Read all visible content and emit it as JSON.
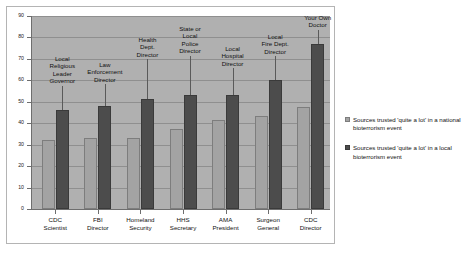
{
  "chart_data": {
    "type": "bar",
    "title": "",
    "subtitle": "",
    "xlabel": "",
    "ylabel": "",
    "ylim": [
      0,
      90
    ],
    "yticks": [
      0,
      10,
      20,
      30,
      40,
      50,
      60,
      70,
      80,
      90
    ],
    "grid": true,
    "legend_position": "right",
    "categories": [
      "CDC Scientist",
      "FBI Director",
      "Homeland Security",
      "HHS Secretary",
      "AMA President",
      "Surgeon General",
      "CDC Director"
    ],
    "category_lines": [
      [
        "CDC",
        "Scientist"
      ],
      [
        "FBI",
        "Director"
      ],
      [
        "Homeland",
        "Security"
      ],
      [
        "HHS",
        "Secretary"
      ],
      [
        "AMA",
        "President"
      ],
      [
        "Surgeon",
        "General"
      ],
      [
        "CDC",
        "Director"
      ]
    ],
    "series": [
      {
        "name": "Sources trusted 'quite a lot' in a national bioterrorism event",
        "color": "#a3a3a3",
        "values": [
          32,
          33,
          33,
          37.5,
          41.5,
          43.5,
          47.5
        ]
      },
      {
        "name": "Sources trusted 'quite a lot' in a local bioterrorism event",
        "color": "#4c4c4c",
        "values": [
          46,
          48,
          51.5,
          53,
          53,
          60,
          77
        ]
      }
    ],
    "annotations": [
      {
        "lines": [
          "Local",
          "Religious",
          "Leader",
          "Governor"
        ],
        "target_category": "CDC Scientist"
      },
      {
        "lines": [
          "Law",
          "Enforcement",
          "Director"
        ],
        "target_category": "FBI Director"
      },
      {
        "lines": [
          "Health",
          "Dept.",
          "Director"
        ],
        "target_category": "Homeland Security"
      },
      {
        "lines": [
          "State or",
          "Local",
          "Police",
          "Director"
        ],
        "target_category": "HHS Secretary"
      },
      {
        "lines": [
          "Local",
          "Hospital",
          "Director"
        ],
        "target_category": "AMA President"
      },
      {
        "lines": [
          "Local",
          "Fire Dept.",
          "Director"
        ],
        "target_category": "Surgeon General"
      },
      {
        "lines": [
          "Your Own",
          "Doctor"
        ],
        "target_category": "CDC Director"
      }
    ]
  },
  "legend": {
    "entries": [
      {
        "label": "Sources trusted 'quite a lot' in a national bioterrorism event",
        "swatch": "light"
      },
      {
        "label": "Sources trusted 'quite a lot' in a local bioterrorism event",
        "swatch": "dark"
      }
    ]
  },
  "colors": {
    "plot_background": "#b0b0b0",
    "page_background": "#ffffff",
    "gridline": "#8f8f8f",
    "axis": "#6e6e6e",
    "series_national": "#a3a3a3",
    "series_local": "#4c4c4c",
    "frame_border": "#b4b4b4"
  }
}
